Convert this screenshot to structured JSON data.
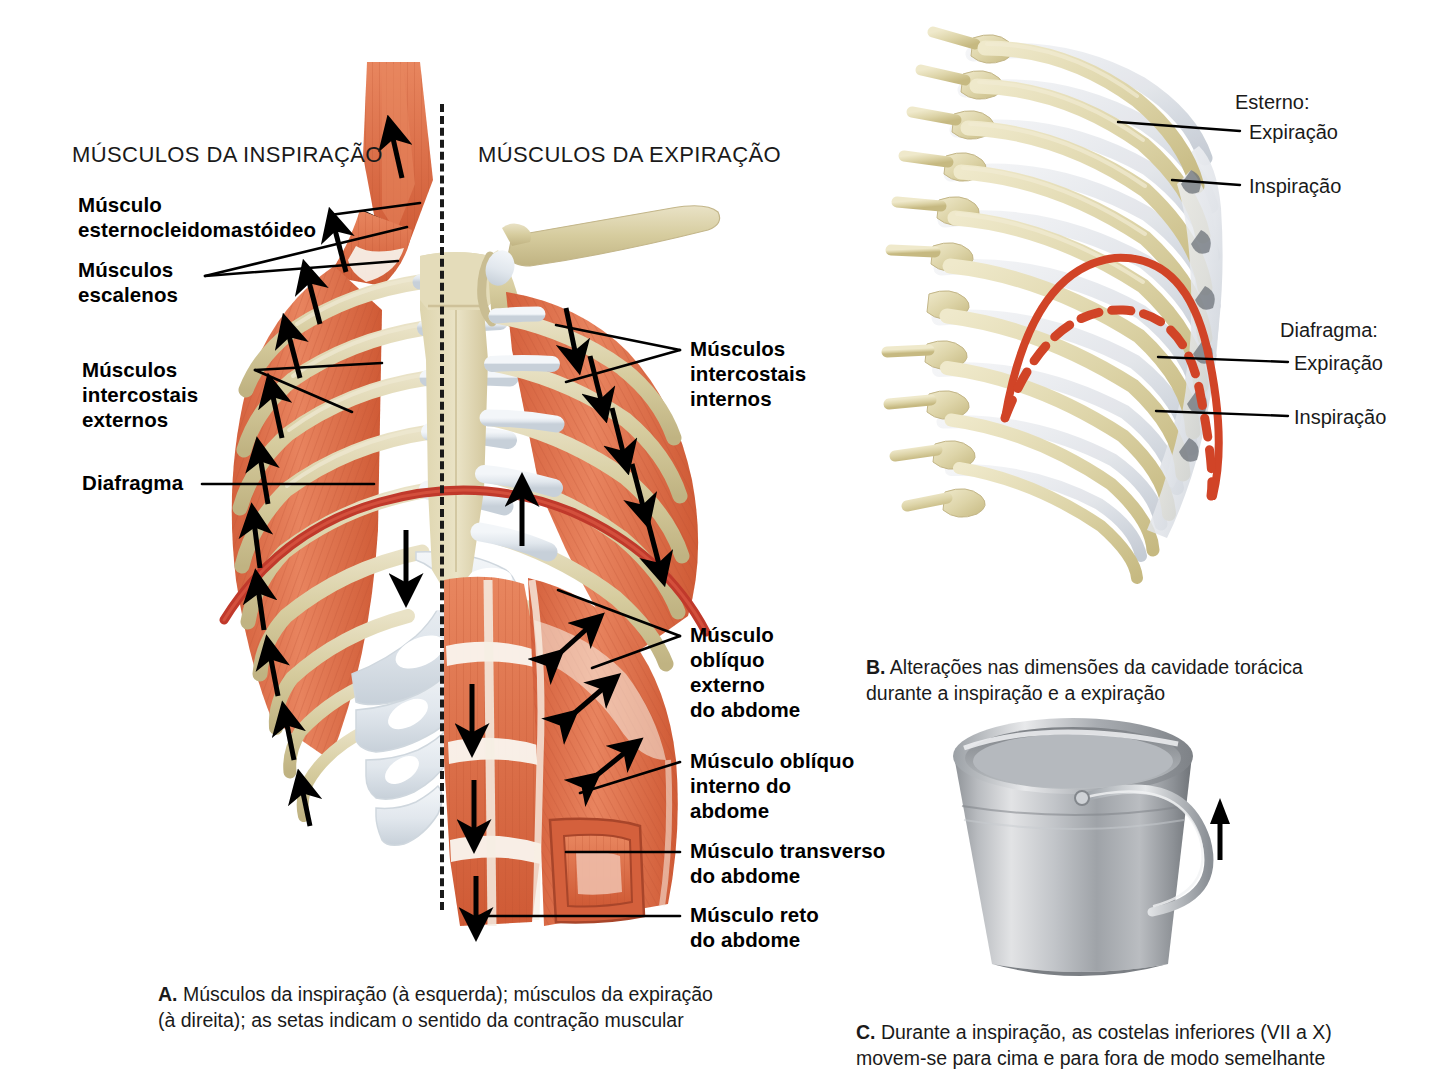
{
  "figure": {
    "background": "#ffffff"
  },
  "colors": {
    "muscle": "#e2714c",
    "muscle_dark": "#c4522f",
    "muscle_light": "#ee9573",
    "tendon": "#f7f1e8",
    "bone": "#d9d0a6",
    "bone_dark": "#bfb282",
    "bone_light": "#e8e2c4",
    "cartilage": "#e6eaee",
    "cartilage_shade": "#c9d2da",
    "diaphragm": "#c0392b",
    "diaphragm_bright": "#d94a2b",
    "ink": "#111111",
    "metal_light": "#e3e4e6",
    "metal_mid": "#a9acb1",
    "metal_dark": "#74787d"
  },
  "panel_a": {
    "headers": {
      "left": "MÚSCULOS DA INSPIRAÇÃO",
      "right": "MÚSCULOS DA EXPIRAÇÃO"
    },
    "divider": "dashed-midline",
    "left_labels": [
      {
        "id": "sternocleidomastoid",
        "text": "Músculo\nesternocleidomastóideo"
      },
      {
        "id": "scalenes",
        "text": "Músculos\nescalenos"
      },
      {
        "id": "external-intercostals",
        "text": "Músculos\nintercostais\nexternos"
      },
      {
        "id": "diaphragm",
        "text": "Diafragma"
      }
    ],
    "right_labels": [
      {
        "id": "internal-intercostals",
        "text": "Músculos\nintercostais\ninternos"
      },
      {
        "id": "external-oblique",
        "text": "Músculo\noblíquo\nexterno\ndo abdome"
      },
      {
        "id": "internal-oblique",
        "text": "Músculo oblíquo\ninterno do\nabdome"
      },
      {
        "id": "transversus-abdominis",
        "text": "Músculo transverso\ndo abdome"
      },
      {
        "id": "rectus-abdominis",
        "text": "Músculo reto\ndo abdome"
      }
    ],
    "caption_marker": "A.",
    "caption_text": " Músculos da inspiração (à esquerda); músculos da expiração\n(à direita); as setas indicam o sentido da contração muscular"
  },
  "panel_b": {
    "labels": [
      {
        "id": "sternum-group",
        "text": "Esterno:",
        "kind": "group"
      },
      {
        "id": "sternum-expiration",
        "text": "Expiração",
        "kind": "leader"
      },
      {
        "id": "sternum-inspiration",
        "text": "Inspiração",
        "kind": "leader"
      },
      {
        "id": "diaphragm-group",
        "text": "Diafragma:",
        "kind": "group"
      },
      {
        "id": "diaphragm-expiration",
        "text": "Expiração",
        "kind": "leader"
      },
      {
        "id": "diaphragm-inspiration",
        "text": "Inspiração",
        "kind": "leader"
      }
    ],
    "caption_marker": "B.",
    "caption_text": " Alterações nas dimensões da cavidade torácica\ndurante a inspiração e a expiração"
  },
  "panel_c": {
    "illustration": "bucket-handle",
    "arrow": "up-arrow",
    "caption_marker": "C.",
    "caption_text": " Durante a inspiração, as costelas inferiores (VII a X)\nmovem-se para cima e para fora de modo semelhante"
  }
}
